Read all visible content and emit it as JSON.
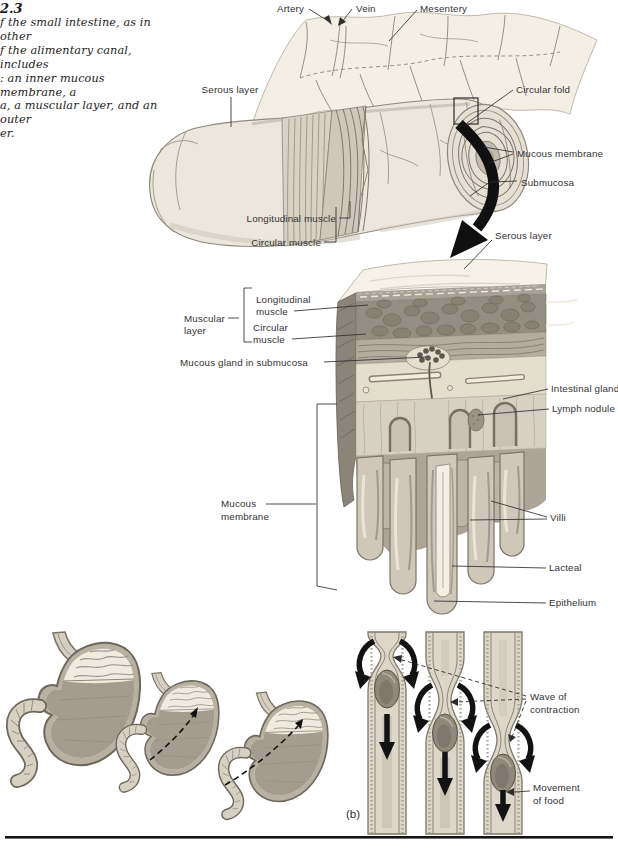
{
  "caption": {
    "figure_number": "2.3",
    "lines": [
      "f the small intestine, as in other",
      "f the alimentary canal, includes",
      ": an inner mucous membrane, a",
      "a, a muscular layer, and an outer",
      "er."
    ]
  },
  "intestine_figure": {
    "labels": {
      "artery": "Artery",
      "vein": "Vein",
      "mesentery": "Mesentery",
      "serous_layer": "Serous layer",
      "circular_fold": "Circular fold",
      "mucous_membrane": "Mucous membrane",
      "submucosa": "Submucosa",
      "longitudinal_muscle": "Longitudinal muscle",
      "circular_muscle": "Circular muscle"
    }
  },
  "magnified_figure": {
    "labels": {
      "serous_layer": "Serous layer",
      "muscular_layer": [
        "Muscular",
        "layer"
      ],
      "longitudinal_muscle": [
        "Longitudinal",
        "muscle"
      ],
      "circular_muscle": [
        "Circular",
        "muscle"
      ],
      "mucous_gland": "Mucous gland in submucosa",
      "intestinal_gland": "Intestinal gland",
      "lymph_nodule": "Lymph nodule",
      "mucous_membrane": [
        "Mucous",
        "membrane"
      ],
      "villi": "Villi",
      "lacteal": "Lacteal",
      "epithelium": "Epithelium"
    }
  },
  "peristalsis_figure": {
    "panel_label": "(b)",
    "labels": {
      "wave_of_contraction": [
        "Wave of",
        "contraction"
      ],
      "movement_of_food": [
        "Movement",
        "of food"
      ]
    }
  },
  "colors": {
    "ink": "#2f2f2f",
    "page": "#ffffff",
    "illustration_tan": "#ece7dc",
    "arrow_black": "#111111"
  }
}
